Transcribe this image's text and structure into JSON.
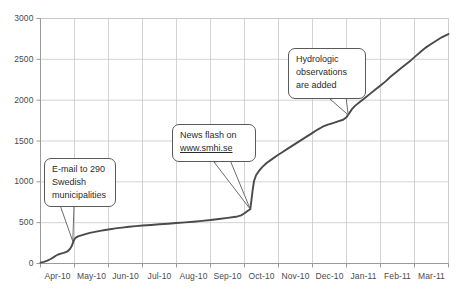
{
  "chart_data": {
    "type": "line",
    "title": "",
    "xlabel": "",
    "ylabel": "",
    "ylim": [
      0,
      3000
    ],
    "yticks": [
      0,
      500,
      1000,
      1500,
      2000,
      2500,
      3000
    ],
    "ytick_labels": [
      "0",
      "500",
      "1000",
      "1500",
      "2000",
      "2500",
      "3000"
    ],
    "categories": [
      "Apr-10",
      "May-10",
      "Jun-10",
      "Jul-10",
      "Aug-10",
      "Sep-10",
      "Oct-10",
      "Nov-10",
      "Dec-10",
      "Jan-11",
      "Feb-11",
      "Mar-11"
    ],
    "grid": true,
    "legend": "none",
    "series": [
      {
        "name": "Cumulative reports",
        "color": "#4a4a4a",
        "points": [
          [
            0.0,
            10
          ],
          [
            0.1,
            20
          ],
          [
            0.2,
            35
          ],
          [
            0.3,
            55
          ],
          [
            0.38,
            75
          ],
          [
            0.45,
            95
          ],
          [
            0.52,
            110
          ],
          [
            0.6,
            120
          ],
          [
            0.68,
            130
          ],
          [
            0.74,
            140
          ],
          [
            0.8,
            150
          ],
          [
            0.86,
            175
          ],
          [
            0.92,
            215
          ],
          [
            0.97,
            270
          ],
          [
            1.0,
            300
          ],
          [
            1.05,
            320
          ],
          [
            1.12,
            335
          ],
          [
            1.2,
            345
          ],
          [
            1.32,
            360
          ],
          [
            1.45,
            375
          ],
          [
            1.6,
            388
          ],
          [
            1.75,
            400
          ],
          [
            1.9,
            410
          ],
          [
            2.05,
            420
          ],
          [
            2.2,
            430
          ],
          [
            2.4,
            440
          ],
          [
            2.6,
            450
          ],
          [
            2.8,
            458
          ],
          [
            3.0,
            465
          ],
          [
            3.25,
            472
          ],
          [
            3.5,
            480
          ],
          [
            3.75,
            487
          ],
          [
            4.0,
            495
          ],
          [
            4.25,
            503
          ],
          [
            4.5,
            512
          ],
          [
            4.75,
            522
          ],
          [
            5.0,
            532
          ],
          [
            5.25,
            545
          ],
          [
            5.5,
            558
          ],
          [
            5.75,
            572
          ],
          [
            5.9,
            590
          ],
          [
            6.0,
            615
          ],
          [
            6.08,
            640
          ],
          [
            6.13,
            655
          ],
          [
            6.17,
            665
          ],
          [
            6.2,
            760
          ],
          [
            6.24,
            900
          ],
          [
            6.28,
            1010
          ],
          [
            6.34,
            1080
          ],
          [
            6.42,
            1130
          ],
          [
            6.52,
            1180
          ],
          [
            6.65,
            1230
          ],
          [
            6.8,
            1275
          ],
          [
            6.95,
            1320
          ],
          [
            7.1,
            1360
          ],
          [
            7.25,
            1400
          ],
          [
            7.4,
            1440
          ],
          [
            7.55,
            1480
          ],
          [
            7.7,
            1520
          ],
          [
            7.85,
            1560
          ],
          [
            8.0,
            1600
          ],
          [
            8.15,
            1640
          ],
          [
            8.3,
            1675
          ],
          [
            8.45,
            1700
          ],
          [
            8.6,
            1720
          ],
          [
            8.75,
            1740
          ],
          [
            8.9,
            1760
          ],
          [
            9.0,
            1790
          ],
          [
            9.08,
            1840
          ],
          [
            9.16,
            1890
          ],
          [
            9.25,
            1930
          ],
          [
            9.4,
            1980
          ],
          [
            9.55,
            2030
          ],
          [
            9.7,
            2080
          ],
          [
            9.85,
            2130
          ],
          [
            10.0,
            2180
          ],
          [
            10.15,
            2230
          ],
          [
            10.3,
            2290
          ],
          [
            10.45,
            2340
          ],
          [
            10.6,
            2390
          ],
          [
            10.75,
            2440
          ],
          [
            10.9,
            2490
          ],
          [
            11.05,
            2545
          ],
          [
            11.2,
            2600
          ],
          [
            11.35,
            2650
          ],
          [
            11.5,
            2690
          ],
          [
            11.65,
            2730
          ],
          [
            11.8,
            2770
          ],
          [
            11.95,
            2800
          ],
          [
            12.0,
            2810
          ]
        ]
      }
    ],
    "annotations": [
      {
        "id": "email-municipalities",
        "lines": [
          "E-mail to 290",
          "Swedish",
          "municipalities"
        ],
        "target_x": 0.95,
        "target_y": 270
      },
      {
        "id": "news-flash",
        "lines": [
          "News flash on"
        ],
        "url": "www.smhi.se",
        "target_x": 6.17,
        "target_y": 665
      },
      {
        "id": "hydrologic-observations",
        "lines": [
          "Hydrologic",
          "observations",
          "are added"
        ],
        "target_x": 9.05,
        "target_y": 1820
      }
    ]
  },
  "axes": {
    "axis_color": "#8a8a8a",
    "grid_color": "#c8c8c8",
    "line_color": "#4a4a4a"
  }
}
